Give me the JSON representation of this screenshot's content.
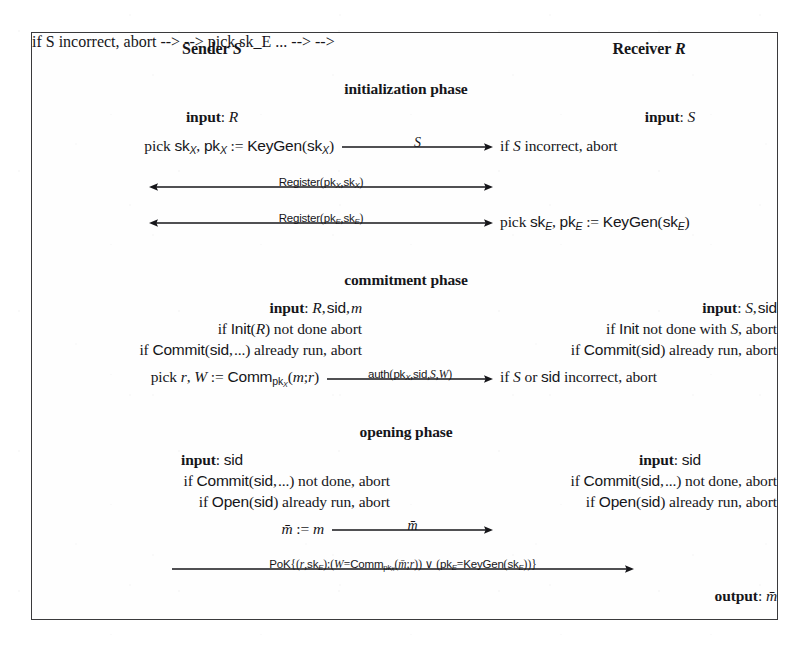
{
  "figure": {
    "kind": "protocol-diagram",
    "parties": {
      "left_label": "Sender S",
      "right_label": "Receiver R"
    },
    "phases": [
      {
        "id": "initialization",
        "title": "initialization phase"
      },
      {
        "id": "commitment",
        "title": "commitment phase"
      },
      {
        "id": "opening",
        "title": "opening phase"
      }
    ],
    "initialization": {
      "left_input": "input: R",
      "right_input": "input: S",
      "left_line1": "pick sk_X, pk_X := KeyGen(sk_X)",
      "right_line1": "if S incorrect, abort",
      "arrow1_label": "S",
      "arrow2_label": "Register(pk_X,sk_X)",
      "arrow3_label": "Register(pk_E,sk_E)",
      "right_line3": "pick sk_E, pk_E := KeyGen(sk_E)"
    },
    "commitment": {
      "left_input": "input: R, sid, m",
      "right_input": "input: S, sid",
      "left_line2": "if Init(R) not done abort",
      "right_line2": "if Init not done with S, abort",
      "left_line3": "if Commit(sid,...) already run, abort",
      "right_line3": "if Commit(sid) already run, abort",
      "left_line4": "pick r, W := Comm_pk_X(m;r)",
      "right_line4": "if S or sid incorrect, abort",
      "arrow_label": "auth(pk_X,sid,S,W)"
    },
    "opening": {
      "left_input": "input: sid",
      "right_input": "input: sid",
      "left_line2": "if Commit(sid,...) not done, abort",
      "right_line2": "if Commit(sid,...) not done, abort",
      "left_line3": "if Open(sid) already run, abort",
      "right_line3": "if Open(sid) already run, abort",
      "left_line4": "m̄ := m",
      "arrow_label_m": "m̄",
      "arrow_label_pok": "PoK{(r,sk_E):(W=Comm_pk_X(m̄;r)) ∨ (pk_E=KeyGen(sk_E))}",
      "right_output": "output: m̄"
    },
    "colors": {
      "ink": "#16161a",
      "frame": "#3a3a3c",
      "paper": "#ffffff"
    }
  }
}
